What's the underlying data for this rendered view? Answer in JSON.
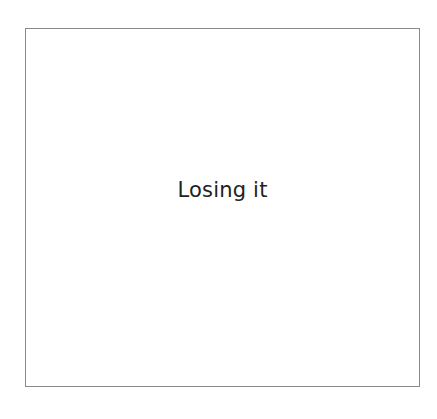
{
  "card": {
    "text": "Losing it",
    "border_color": "#8a8a8a",
    "text_color": "#222222",
    "background": "#ffffff"
  }
}
